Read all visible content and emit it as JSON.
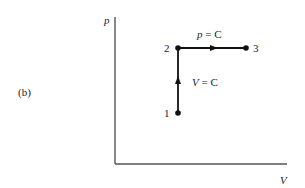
{
  "figure": {
    "panel_label": "(b)",
    "axes": {
      "y_label": "p",
      "x_label": "V"
    },
    "points": [
      {
        "id": "1",
        "label": "1"
      },
      {
        "id": "2",
        "label": "2"
      },
      {
        "id": "3",
        "label": "3"
      }
    ],
    "processes": [
      {
        "from": "1",
        "to": "2",
        "label_var": "V",
        "label_rest": " = C",
        "description": "constant volume"
      },
      {
        "from": "2",
        "to": "3",
        "label_var": "p",
        "label_rest": " = C",
        "description": "constant pressure"
      }
    ]
  },
  "colors": {
    "line": "#111111",
    "axis": "#444444",
    "text": "#222222"
  }
}
